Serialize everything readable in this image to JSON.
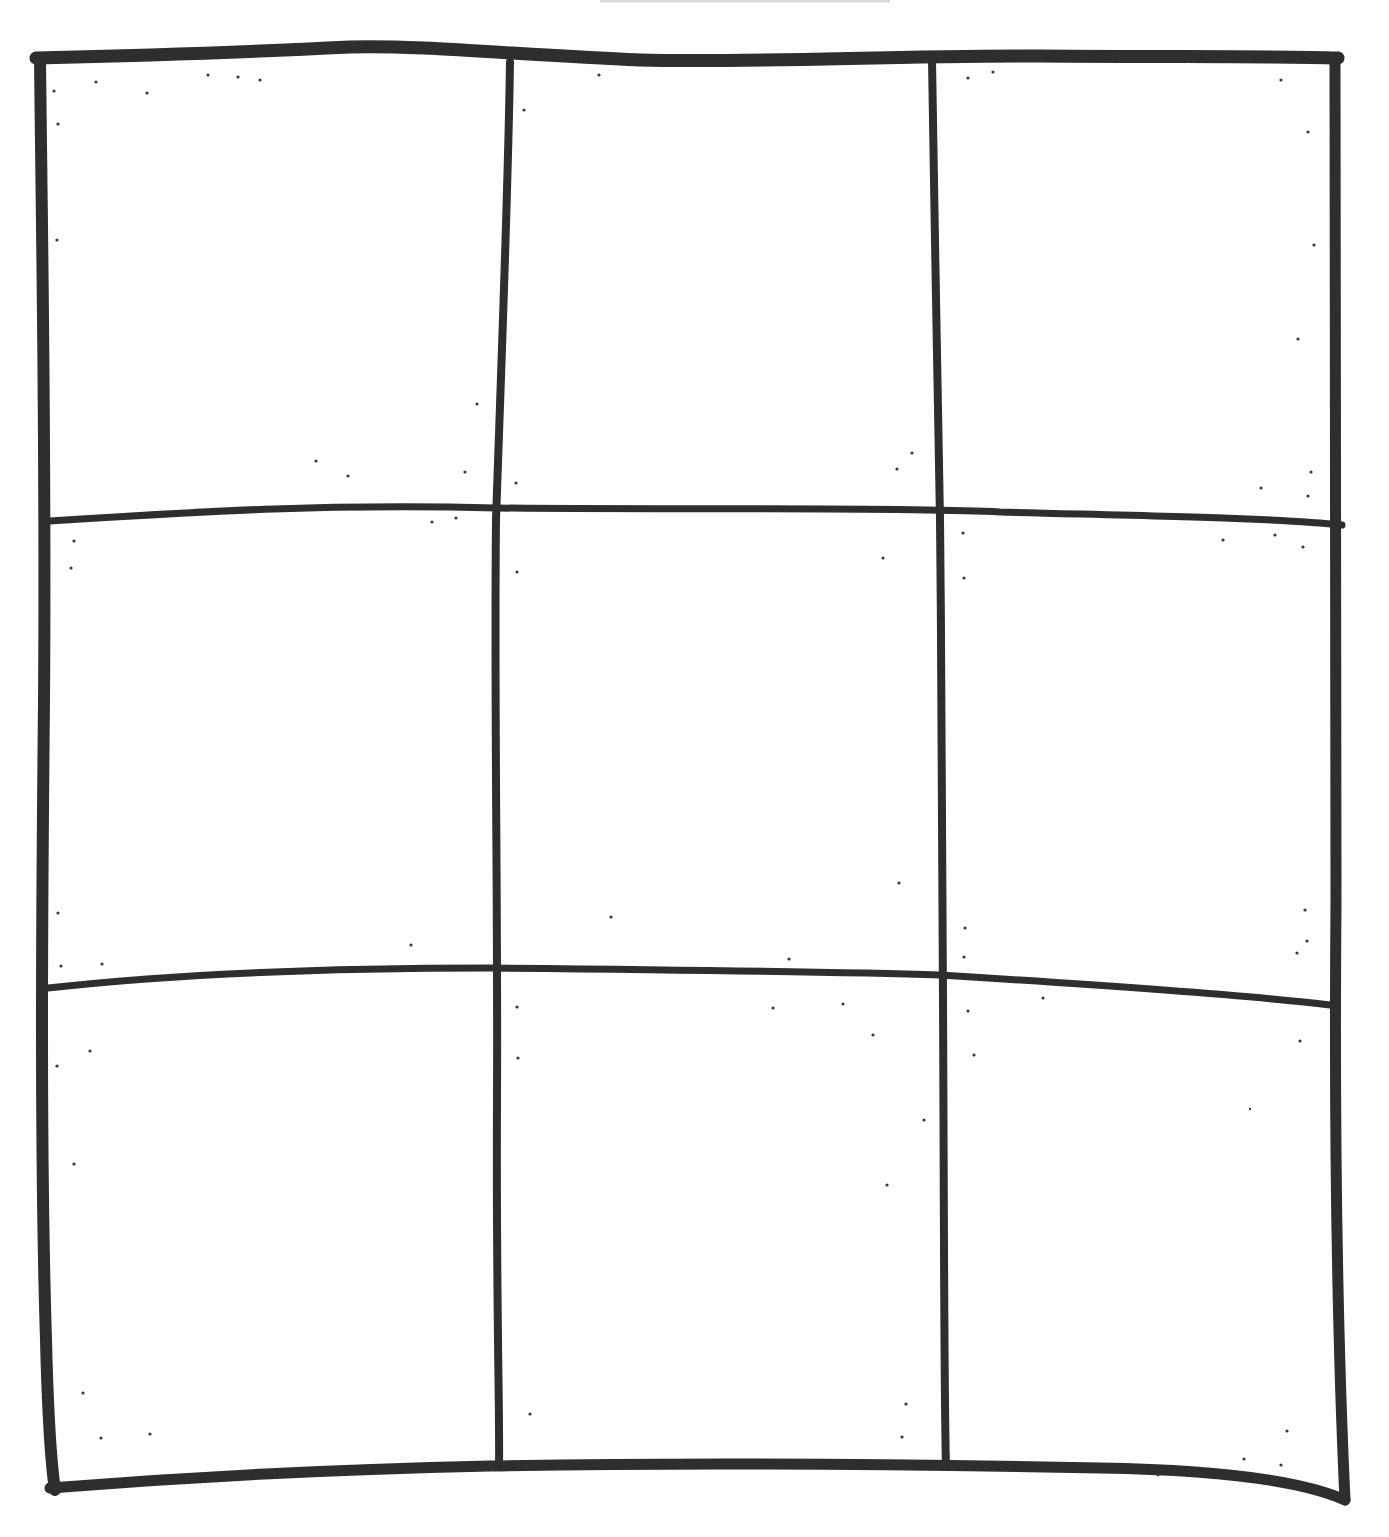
{
  "drawing": {
    "title": "Hand-drawn 3x3 grid",
    "rows": 3,
    "columns": 3,
    "ink_color": "#2e2e2e",
    "paper_color": "#ffffff",
    "top_faint_line_color": "#d8d8d8",
    "cells": [
      {
        "row": 1,
        "col": 1,
        "content": ""
      },
      {
        "row": 1,
        "col": 2,
        "content": ""
      },
      {
        "row": 1,
        "col": 3,
        "content": ""
      },
      {
        "row": 2,
        "col": 1,
        "content": ""
      },
      {
        "row": 2,
        "col": 2,
        "content": ""
      },
      {
        "row": 2,
        "col": 3,
        "content": ""
      },
      {
        "row": 3,
        "col": 1,
        "content": ""
      },
      {
        "row": 3,
        "col": 2,
        "content": ""
      },
      {
        "row": 3,
        "col": 3,
        "content": ""
      }
    ]
  }
}
